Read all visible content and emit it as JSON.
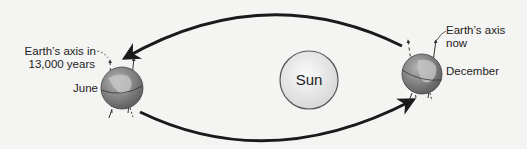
{
  "diagram": {
    "sun": {
      "label": "Sun"
    },
    "earth_june": {
      "season_label": "June",
      "axis_label_line1": "Earth’s axis in",
      "axis_label_line2": "13,000 years"
    },
    "earth_december": {
      "season_label": "December",
      "axis_label_line1": "Earth’s axis",
      "axis_label_line2": "now"
    },
    "colors": {
      "orbit_arrow": "#1a1a1a",
      "sun_fill": "#ececec",
      "sun_stroke": "#555555",
      "earth_ocean": "#8a8a8a",
      "earth_land": "#c8c8c8"
    }
  }
}
